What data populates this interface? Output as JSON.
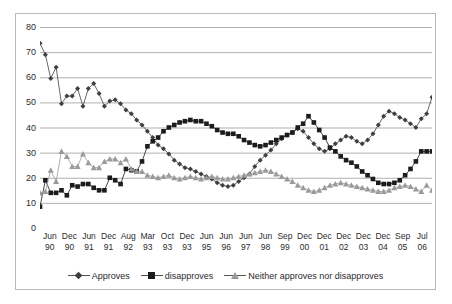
{
  "chart_data": {
    "type": "line",
    "title": "",
    "xlabel": "",
    "ylabel": "",
    "ylim": [
      0,
      80
    ],
    "ytick_step": 10,
    "yticks": [
      80,
      70,
      60,
      50,
      40,
      30,
      20,
      10,
      0
    ],
    "grid": true,
    "legend_position": "bottom",
    "x_tick_labels": [
      {
        "month": "Jun",
        "year": "90"
      },
      {
        "month": "Dec",
        "year": "90"
      },
      {
        "month": "Jun",
        "year": "91"
      },
      {
        "month": "Dec",
        "year": "91"
      },
      {
        "month": "Aug",
        "year": "92"
      },
      {
        "month": "Mar",
        "year": "93"
      },
      {
        "month": "Oct",
        "year": "93"
      },
      {
        "month": "Dec",
        "year": "93"
      },
      {
        "month": "Jun",
        "year": "95"
      },
      {
        "month": "Jun",
        "year": "96"
      },
      {
        "month": "Jun",
        "year": "97"
      },
      {
        "month": "Jun",
        "year": "98"
      },
      {
        "month": "Sep",
        "year": "99"
      },
      {
        "month": "Dec",
        "year": "00"
      },
      {
        "month": "Dec",
        "year": "01"
      },
      {
        "month": "Dec",
        "year": "02"
      },
      {
        "month": "Dec",
        "year": "03"
      },
      {
        "month": "Dec",
        "year": "04"
      },
      {
        "month": "Sep",
        "year": "05"
      },
      {
        "month": "Jul",
        "year": "06"
      }
    ],
    "n_points": 74,
    "series": [
      {
        "name": "Approves",
        "marker": "diamond",
        "color": "#3f3f3f",
        "values": [
          73.5,
          69,
          59.5,
          64,
          49.5,
          52.5,
          52.5,
          55.5,
          48.5,
          55.5,
          57.5,
          53.5,
          48.5,
          50.5,
          51,
          49.5,
          47,
          45.5,
          43,
          41,
          38.5,
          36,
          33,
          31.5,
          29.5,
          27,
          25.5,
          24,
          23.5,
          22.5,
          21.5,
          20.5,
          19.5,
          18,
          17,
          16.5,
          17,
          18.5,
          20,
          21.5,
          24.5,
          27,
          29,
          31,
          33.5,
          35.5,
          37,
          38,
          39.5,
          38.5,
          36,
          33.5,
          31.5,
          30.5,
          31.5,
          33.5,
          35,
          36.5,
          36,
          34.5,
          33.5,
          35,
          37.5,
          41,
          44.5,
          46.5,
          45.5,
          44,
          43,
          41.5,
          40,
          43.5,
          45.5,
          52
        ]
      },
      {
        "name": "disapproves",
        "marker": "square",
        "color": "#1c1c1c",
        "values": [
          8.5,
          19,
          14,
          14,
          15,
          13,
          17,
          16.5,
          17.5,
          17.5,
          16,
          15,
          15,
          20,
          19,
          17.5,
          23.5,
          23,
          22.5,
          26.5,
          32.5,
          34.5,
          36,
          38.5,
          40,
          41,
          42,
          42.5,
          43,
          42.5,
          42.5,
          41.5,
          40.5,
          39,
          38,
          37.5,
          37.5,
          36.5,
          35,
          34,
          33,
          32.5,
          33,
          34,
          35,
          36,
          37,
          38,
          40,
          41.5,
          44.5,
          42,
          39,
          36,
          32,
          30.5,
          28.5,
          27,
          26,
          24.5,
          22.5,
          21,
          19.5,
          18,
          17.5,
          17.5,
          18,
          19,
          21,
          23.5,
          26.5,
          30.5,
          30.5,
          30.5
        ]
      },
      {
        "name": "Neither approves nor disapproves",
        "marker": "triangle",
        "color": "#9a9a9a",
        "values": [
          14,
          14.5,
          23,
          18.5,
          30.5,
          28.5,
          24.5,
          24.5,
          29.5,
          26,
          24,
          24,
          26.5,
          27.5,
          27.5,
          26,
          27.5,
          23.5,
          22.5,
          22.5,
          21,
          20.5,
          20,
          20.5,
          21,
          20,
          19.5,
          20,
          20.5,
          20,
          19.5,
          20,
          20.5,
          20,
          19.5,
          19.5,
          20,
          20.5,
          21,
          21.5,
          22,
          22.5,
          23,
          22.5,
          21.5,
          20.5,
          19.5,
          18.5,
          17,
          16,
          15,
          14.5,
          15,
          16,
          17,
          17.5,
          18,
          17.5,
          17,
          16.5,
          16,
          15.5,
          15,
          14.5,
          14.5,
          15,
          16,
          16.5,
          17,
          16.5,
          15.5,
          14.5,
          17,
          15
        ]
      }
    ]
  }
}
